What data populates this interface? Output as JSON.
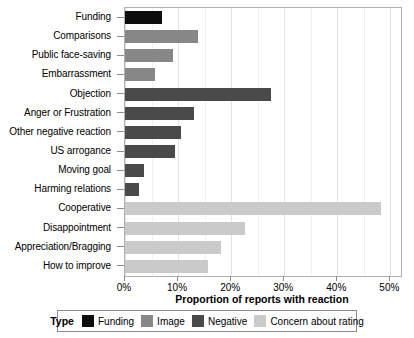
{
  "chart_data": {
    "type": "bar",
    "orientation": "horizontal",
    "title": "",
    "xlabel": "Proportion of reports with reaction",
    "ylabel": "",
    "xlim": [
      0,
      52
    ],
    "grid": true,
    "xticks": [
      "0%",
      "10%",
      "20%",
      "30%",
      "40%",
      "50%"
    ],
    "xtick_values": [
      0,
      10,
      20,
      30,
      40,
      50
    ],
    "legend_position": "bottom",
    "legend_title": "Type",
    "categories": [
      "Funding",
      "Comparisons",
      "Public face-saving",
      "Embarrassment",
      "Objection",
      "Anger or Frustration",
      "Other negative reaction",
      "US arrogance",
      "Moving goal",
      "Harming relations",
      "Cooperative",
      "Disappointment",
      "Appreciation/Bragging",
      "How to improve"
    ],
    "values": [
      6.9,
      13.8,
      9.0,
      5.6,
      27.6,
      13.0,
      10.5,
      9.5,
      3.6,
      2.7,
      48.2,
      22.7,
      18.0,
      15.6
    ],
    "groups": [
      "Funding",
      "Image",
      "Image",
      "Image",
      "Negative",
      "Negative",
      "Negative",
      "Negative",
      "Negative",
      "Negative",
      "Concern about rating",
      "Concern about rating",
      "Concern about rating",
      "Concern about rating"
    ],
    "series": [
      {
        "name": "Funding",
        "color": "#0d0d0d",
        "points": [
          {
            "category": "Funding",
            "value": 6.9
          }
        ]
      },
      {
        "name": "Image",
        "color": "#878787",
        "points": [
          {
            "category": "Comparisons",
            "value": 13.8
          },
          {
            "category": "Public face-saving",
            "value": 9.0
          },
          {
            "category": "Embarrassment",
            "value": 5.6
          }
        ]
      },
      {
        "name": "Negative",
        "color": "#4a4a4a",
        "points": [
          {
            "category": "Objection",
            "value": 27.6
          },
          {
            "category": "Anger or Frustration",
            "value": 13.0
          },
          {
            "category": "Other negative reaction",
            "value": 10.5
          },
          {
            "category": "US arrogance",
            "value": 9.5
          },
          {
            "category": "Moving goal",
            "value": 3.6
          },
          {
            "category": "Harming relations",
            "value": 2.7
          }
        ]
      },
      {
        "name": "Concern about rating",
        "color": "#cacaca",
        "points": [
          {
            "category": "Cooperative",
            "value": 48.2
          },
          {
            "category": "Disappointment",
            "value": 22.7
          },
          {
            "category": "Appreciation/Bragging",
            "value": 18.0
          },
          {
            "category": "How to improve",
            "value": 15.6
          }
        ]
      }
    ]
  },
  "legend": {
    "title": "Type",
    "items": [
      {
        "label": "Funding",
        "color": "#0d0d0d",
        "swatch": "legend-swatch-funding"
      },
      {
        "label": "Image",
        "color": "#878787",
        "swatch": "legend-swatch-image"
      },
      {
        "label": "Negative",
        "color": "#4a4a4a",
        "swatch": "legend-swatch-negative"
      },
      {
        "label": "Concern about rating",
        "color": "#cacaca",
        "swatch": "legend-swatch-concern"
      }
    ]
  },
  "colors": {
    "funding": "#0d0d0d",
    "image": "#878787",
    "negative": "#4a4a4a",
    "concern": "#cacaca",
    "panel_border": "#b0b0b0",
    "grid_major": "#e2e2e2",
    "grid_minor": "#f0f0f0",
    "axis": "#8c8c8c",
    "background": "#ffffff"
  }
}
